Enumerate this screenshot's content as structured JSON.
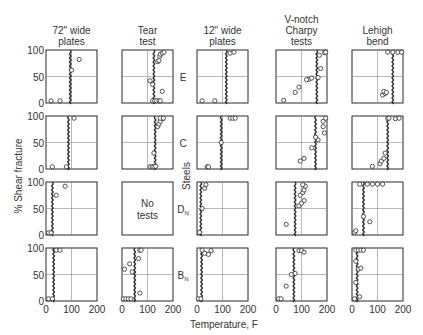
{
  "chart_data": {
    "type": "scatter",
    "title": "",
    "xlabel": "Temperature, F",
    "ylabel": "% Shear fracture",
    "row_axis_label": "Steels",
    "xlim": [
      0,
      200
    ],
    "ylim": [
      0,
      100
    ],
    "x_ticks": [
      "0",
      "100",
      "200"
    ],
    "y_ticks": [
      "0",
      "50",
      "100"
    ],
    "grid": "center crosshair at x=100, y=50",
    "columns": [
      {
        "label": "72\" wide plates"
      },
      {
        "label": "Tear test"
      },
      {
        "label": "12\" wide plates"
      },
      {
        "label": "V-notch Charpy tests"
      },
      {
        "label": "Lehigh bend"
      }
    ],
    "rows": [
      {
        "label": "E",
        "sub": ""
      },
      {
        "label": "C",
        "sub": ""
      },
      {
        "label": "D",
        "sub": "N"
      },
      {
        "label": "B",
        "sub": "N"
      }
    ],
    "panels": [
      [
        {
          "transition": 95,
          "points": [
            [
              20,
              2
            ],
            [
              55,
              2
            ],
            [
              100,
              62
            ],
            [
              130,
              82
            ]
          ]
        },
        {
          "transition": 125,
          "points": [
            [
              120,
              2
            ],
            [
              128,
              2
            ],
            [
              135,
              2
            ],
            [
              145,
              3
            ],
            [
              150,
              2
            ],
            [
              158,
              22
            ],
            [
              110,
              42
            ],
            [
              120,
              35
            ],
            [
              148,
              88
            ],
            [
              150,
              92
            ],
            [
              158,
              94
            ],
            [
              165,
              96
            ],
            [
              140,
              78
            ],
            [
              145,
              80
            ]
          ]
        },
        {
          "transition": 115,
          "points": [
            [
              20,
              2
            ],
            [
              70,
              2
            ],
            [
              130,
              94
            ],
            [
              145,
              96
            ]
          ]
        },
        {
          "transition": 160,
          "points": [
            [
              30,
              5
            ],
            [
              75,
              20
            ],
            [
              90,
              30
            ],
            [
              130,
              45
            ],
            [
              140,
              47
            ],
            [
              120,
              44
            ],
            [
              165,
              48
            ],
            [
              175,
              65
            ],
            [
              170,
              90
            ],
            [
              190,
              95
            ],
            [
              195,
              100
            ]
          ]
        },
        {
          "transition": 160,
          "points": [
            [
              120,
              15
            ],
            [
              130,
              18
            ],
            [
              125,
              22
            ],
            [
              135,
              20
            ],
            [
              140,
              100
            ],
            [
              160,
              100
            ],
            [
              180,
              100
            ],
            [
              195,
              100
            ]
          ]
        }
      ],
      [
        {
          "transition": 88,
          "points": [
            [
              25,
              2
            ],
            [
              80,
              2
            ],
            [
              110,
              100
            ]
          ]
        },
        {
          "transition": 130,
          "points": [
            [
              110,
              2
            ],
            [
              118,
              2
            ],
            [
              125,
              2
            ],
            [
              132,
              5
            ],
            [
              125,
              30
            ],
            [
              140,
              80
            ],
            [
              145,
              85
            ],
            [
              150,
              90
            ],
            [
              160,
              95
            ],
            [
              150,
              100
            ],
            [
              162,
              100
            ]
          ]
        },
        {
          "transition": 95,
          "points": [
            [
              40,
              2
            ],
            [
              45,
              2
            ],
            [
              95,
              50
            ],
            [
              130,
              98
            ],
            [
              140,
              96
            ],
            [
              150,
              100
            ]
          ]
        },
        {
          "transition": 155,
          "points": [
            [
              95,
              15
            ],
            [
              110,
              20
            ],
            [
              140,
              40
            ],
            [
              165,
              55
            ],
            [
              155,
              60
            ],
            [
              185,
              80
            ],
            [
              190,
              68
            ],
            [
              185,
              90
            ],
            [
              195,
              100
            ]
          ]
        },
        {
          "transition": 140,
          "points": [
            [
              80,
              5
            ],
            [
              110,
              10
            ],
            [
              115,
              15
            ],
            [
              125,
              20
            ],
            [
              130,
              30
            ],
            [
              140,
              95
            ],
            [
              145,
              100
            ],
            [
              170,
              95
            ],
            [
              185,
              98
            ]
          ]
        }
      ],
      [
        {
          "transition": 25,
          "points": [
            [
              10,
              2
            ],
            [
              20,
              2
            ],
            [
              40,
              75
            ],
            [
              75,
              92
            ]
          ]
        },
        null,
        {
          "transition": 15,
          "points": [
            [
              10,
              5
            ],
            [
              20,
              50
            ],
            [
              30,
              88
            ],
            [
              35,
              95
            ]
          ]
        },
        {
          "transition": 75,
          "points": [
            [
              40,
              20
            ],
            [
              90,
              55
            ],
            [
              100,
              60
            ],
            [
              110,
              65
            ],
            [
              95,
              75
            ],
            [
              105,
              80
            ],
            [
              110,
              85
            ],
            [
              115,
              92
            ],
            [
              105,
              95
            ]
          ]
        },
        {
          "transition": 45,
          "points": [
            [
              10,
              5
            ],
            [
              15,
              8
            ],
            [
              45,
              35
            ],
            [
              70,
              25
            ],
            [
              30,
              100
            ],
            [
              60,
              100
            ],
            [
              80,
              100
            ],
            [
              100,
              100
            ],
            [
              120,
              100
            ]
          ]
        }
      ],
      [
        {
          "transition": 30,
          "points": [
            [
              10,
              2
            ],
            [
              25,
              2
            ],
            [
              40,
              100
            ],
            [
              55,
              100
            ]
          ]
        },
        {
          "transition": 50,
          "points": [
            [
              5,
              2
            ],
            [
              15,
              2
            ],
            [
              25,
              2
            ],
            [
              35,
              2
            ],
            [
              10,
              60
            ],
            [
              30,
              70
            ],
            [
              40,
              55
            ],
            [
              70,
              15
            ],
            [
              65,
              80
            ],
            [
              70,
              98
            ],
            [
              75,
              100
            ]
          ]
        },
        {
          "transition": 18,
          "points": [
            [
              5,
              2
            ],
            [
              15,
              3
            ],
            [
              20,
              98
            ],
            [
              30,
              90
            ],
            [
              45,
              88
            ],
            [
              55,
              95
            ]
          ]
        },
        {
          "transition": 70,
          "points": [
            [
              10,
              2
            ],
            [
              20,
              2
            ],
            [
              40,
              28
            ],
            [
              60,
              50
            ],
            [
              75,
              52
            ],
            [
              90,
              95
            ],
            [
              100,
              95
            ],
            [
              110,
              92
            ]
          ]
        },
        {
          "transition": 20,
          "points": [
            [
              10,
              2
            ],
            [
              30,
              8
            ],
            [
              15,
              35
            ],
            [
              25,
              60
            ],
            [
              35,
              62
            ],
            [
              15,
              75
            ],
            [
              15,
              100
            ],
            [
              25,
              100
            ],
            [
              35,
              100
            ],
            [
              45,
              100
            ]
          ]
        }
      ]
    ],
    "no_data_text": [
      "No",
      "tests"
    ]
  }
}
